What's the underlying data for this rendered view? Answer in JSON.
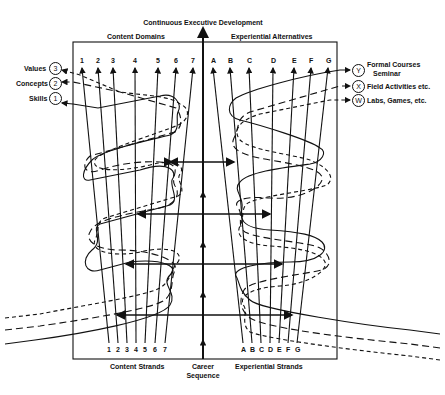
{
  "title": "Continuous Executive Development",
  "top_labels": {
    "left": "Content Domains",
    "right": "Experiential Alternatives"
  },
  "bottom_labels": {
    "left": "Content Strands",
    "center_line1": "Career",
    "center_line2": "Sequence",
    "right": "Experiential Strands"
  },
  "content_domains": [
    "1",
    "2",
    "3",
    "4",
    "5",
    "6",
    "7"
  ],
  "experiential_alternatives": [
    "A",
    "B",
    "C",
    "D",
    "E",
    "F",
    "G"
  ],
  "content_strands": [
    "1",
    "2",
    "3",
    "4",
    "5",
    "6",
    "7"
  ],
  "experiential_strands": [
    "A",
    "B",
    "C",
    "D",
    "E",
    "F",
    "G"
  ],
  "left_legend": [
    {
      "label": "Values",
      "symbol": "3"
    },
    {
      "label": "Concepts",
      "symbol": "2"
    },
    {
      "label": "Skills",
      "symbol": "1"
    }
  ],
  "right_legend": [
    {
      "symbol": "Y",
      "label": "Formal Courses",
      "label2": "Seminar"
    },
    {
      "symbol": "X",
      "label": "Field Activities etc."
    },
    {
      "symbol": "W",
      "label": "Labs, Games, etc."
    }
  ]
}
